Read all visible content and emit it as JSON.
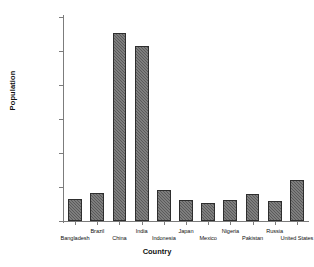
{
  "chart_data": {
    "type": "bar",
    "title": "",
    "xlabel": "Country",
    "ylabel": "Population",
    "categories": [
      "Bangladesh",
      "Brazil",
      "China",
      "India",
      "Indonesia",
      "Japan",
      "Mexico",
      "Nigeria",
      "Pakistan",
      "Russia",
      "United States"
    ],
    "values": [
      165000000,
      205000000,
      1385000000,
      1285000000,
      230000000,
      155000000,
      130000000,
      155000000,
      195000000,
      145000000,
      300000000
    ],
    "ylim": [
      0,
      1500000000
    ],
    "yticks": [
      0,
      250000000,
      500000000,
      750000000,
      1000000000,
      1250000000,
      1500000000
    ],
    "ytick_labels": [
      "0",
      "250,000,000",
      "500,000,000",
      "750,000,000",
      "1,000,000,000",
      "1,250,000,000",
      "1,500,000,000"
    ],
    "grid": false,
    "legend": null,
    "bar_color": "#5a5a5a",
    "bar_edge_color": "#2e2e2e",
    "axis_color": "#7c7c7c",
    "background": "#ffffff"
  }
}
